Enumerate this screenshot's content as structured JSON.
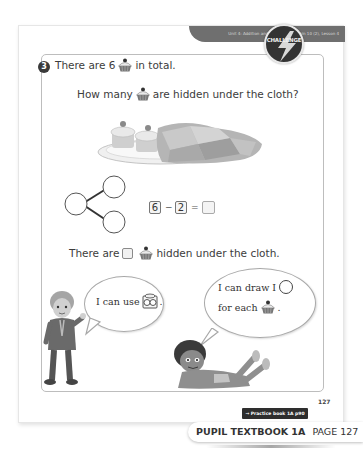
{
  "header": {
    "unit_banner": "Unit 4: Addition and subtraction within 10 (2), Lesson 4"
  },
  "badge": {
    "label": "CHALLENGE",
    "icon": "lightning-bolt-icon"
  },
  "question": {
    "number": "3",
    "line1_pre": "There are 6",
    "line1_post": "in total.",
    "line2_pre": "How many",
    "line2_post": "are hidden under the cloth?",
    "item_icon": "cupcake-icon"
  },
  "illustration": {
    "description": "plate with 2 cupcakes, rest covered by cloth",
    "visible_cupcakes": 2
  },
  "part_whole": {
    "whole": "",
    "parts": [
      "",
      ""
    ]
  },
  "equation": {
    "a": "6",
    "op": "−",
    "b": "2",
    "eq": "=",
    "result": ""
  },
  "answer_line": {
    "pre": "There are",
    "post": "hidden under the cloth.",
    "answer": ""
  },
  "speech": {
    "left": {
      "pre": "I can use",
      "post": ".",
      "icon": "ten-frame-counter-icon"
    },
    "right": {
      "line1_pre": "I can draw I",
      "line2_pre": "for each",
      "line2_post": ".",
      "icon": "circle-icon"
    }
  },
  "footer": {
    "practice_link": "→ Practice book 1A p90",
    "page_number": "127",
    "book_label": "PUPIL TEXTBOOK 1A",
    "page_label": "PAGE 127"
  },
  "colors": {
    "banner": "#6f6f6f",
    "badge": "#333333",
    "text": "#3c3c3c"
  }
}
